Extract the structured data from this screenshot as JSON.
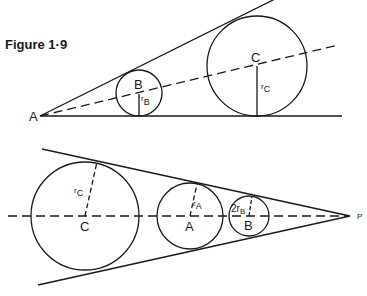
{
  "figure": {
    "title": "Figure 1·9"
  },
  "top_diagram": {
    "vertex_label": "A",
    "circles": [
      {
        "label": "B",
        "radius_label": "r",
        "radius_sub": "B",
        "cx": 139,
        "cy": 93,
        "r": 23
      },
      {
        "label": "C",
        "radius_label": "r",
        "radius_sub": "C",
        "cx": 257,
        "cy": 66,
        "r": 50
      }
    ]
  },
  "bottom_diagram": {
    "vertex_label": "P",
    "circles": [
      {
        "label": "C",
        "radius_label": "r",
        "radius_sub": "C",
        "cx": 85,
        "cy": 216,
        "r": 54
      },
      {
        "label": "A",
        "radius_label": "r",
        "radius_sub": "A",
        "cx": 190,
        "cy": 216,
        "r": 33
      },
      {
        "label": "B",
        "radius_label": "2r",
        "radius_sub": "B",
        "cx": 249,
        "cy": 216,
        "r": 20
      }
    ]
  },
  "colors": {
    "stroke": "#1a1a1a",
    "background": "#ffffff"
  }
}
